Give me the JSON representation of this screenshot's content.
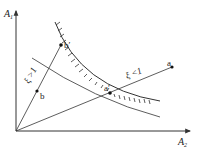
{
  "diagram": {
    "axes": {
      "y_label": "A",
      "y_sub": "1",
      "x_label": "A",
      "x_sub": "2"
    },
    "points": {
      "a": "a",
      "a_prime": "a′",
      "b": "b",
      "b_prime": "b′"
    },
    "annotations": {
      "xi_gt_1": "ξ >1",
      "xi_lt_1": "ξ <1"
    },
    "colors": {
      "line": "#333333",
      "background": "#ffffff"
    }
  }
}
